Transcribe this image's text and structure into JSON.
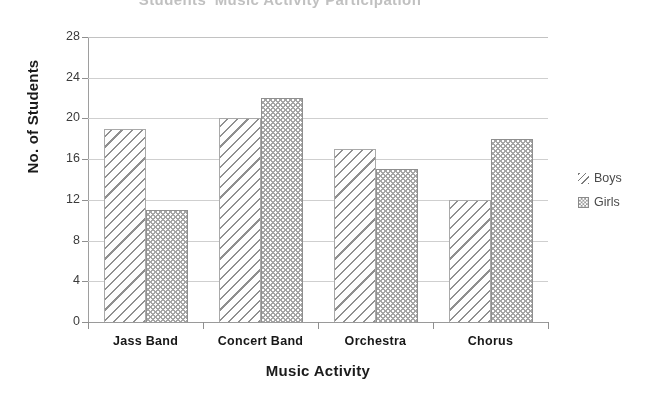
{
  "chart_data": {
    "type": "bar",
    "title": "Students' Music Activity Participation",
    "xlabel": "Music Activity",
    "ylabel": "No. of Students",
    "categories": [
      "Jass Band",
      "Concert Band",
      "Orchestra",
      "Chorus"
    ],
    "series": [
      {
        "name": "Boys",
        "values": [
          19,
          20,
          17,
          12
        ],
        "pattern": "diagonal-hatch"
      },
      {
        "name": "Girls",
        "values": [
          11,
          22,
          15,
          18
        ],
        "pattern": "dotted-fill"
      }
    ],
    "ylim": [
      0,
      28
    ],
    "yticks": [
      0,
      4,
      8,
      12,
      16,
      20,
      24,
      28
    ],
    "ytick_labels": [
      "0",
      "4",
      "8",
      "12",
      "16",
      "20",
      "24",
      "28"
    ],
    "grid": "horizontal",
    "legend_position": "right",
    "legend_entries": [
      "Boys",
      "Girls"
    ],
    "colors": {
      "boys_hatch": "#8e8e8e",
      "girls_fill": "#a5a5a5",
      "gridline": "#c2c2c2",
      "axis": "#9a9a9a",
      "text": "#1b1b1b"
    }
  },
  "legend": {
    "boys_label": "Boys",
    "girls_label": "Girls"
  }
}
